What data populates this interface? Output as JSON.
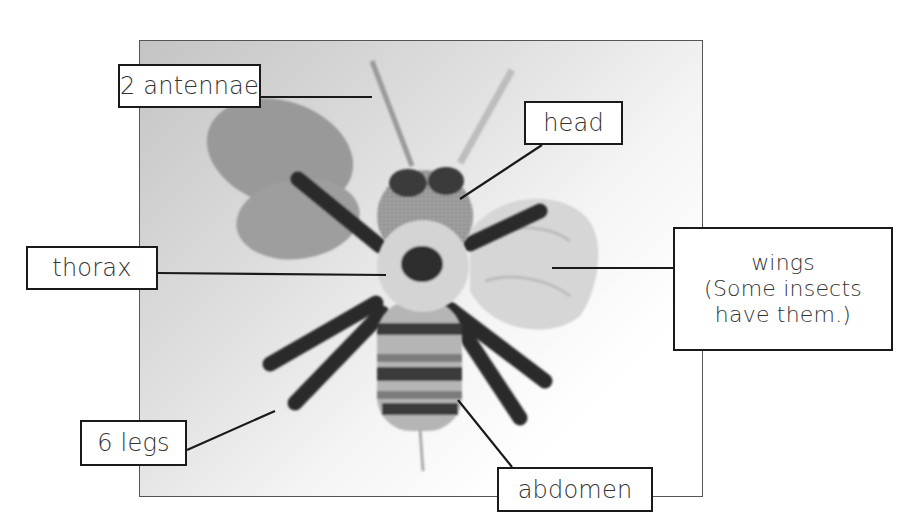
{
  "diagram": {
    "labels": {
      "antennae": "2 antennae",
      "head": "head",
      "thorax": "thorax",
      "wings_line1": "wings",
      "wings_line2": "(Some insects",
      "wings_line3": "have them.)",
      "legs": "6 legs",
      "abdomen": "abdomen"
    },
    "colors": {
      "label_border": "#1a1a1a",
      "label_text": "#333333",
      "leader_line": "#1a1a1a",
      "frame_border": "#555555"
    }
  }
}
